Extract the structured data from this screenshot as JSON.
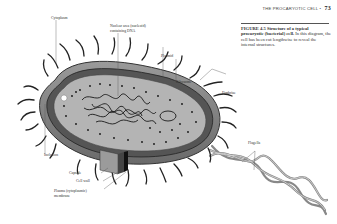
{
  "page": {
    "running_head": "THE PROCARYOTIC CELL",
    "bullet": "•",
    "page_number": "73"
  },
  "caption": {
    "figure_label": "FIGURE 4.5",
    "title": "Structure of a typical procaryotic (bacterial) cell.",
    "body": "In this diagram, the cell has been cut lengthwise to reveal the internal structures."
  },
  "diagram": {
    "labels": {
      "cytoplasm": "Cytoplasm",
      "nuclear_area_1": "Nuclear area (nucleoid)",
      "nuclear_area_2": "containing DNA",
      "plasmid": "Plasmid",
      "ribosome": "Ribosome",
      "fimbriae": "Fimbriae",
      "flagella": "Flagella",
      "inclusion": "Inclusion",
      "capsule": "Capsule",
      "cell_wall": "Cell wall",
      "plasma_membrane_1": "Plasma (cytoplasmic)",
      "plasma_membrane_2": "membrane"
    }
  }
}
